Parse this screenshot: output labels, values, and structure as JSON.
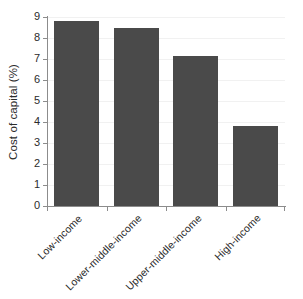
{
  "chart_data": {
    "type": "bar",
    "title": "",
    "subtitle": "",
    "xlabel": "",
    "ylabel": "Cost of capital (%)",
    "categories": [
      "Low-income",
      "Lower-middle-income",
      "Upper-middle-income",
      "High-income"
    ],
    "values": [
      8.8,
      8.5,
      7.15,
      3.8
    ],
    "ylim": [
      0,
      9
    ],
    "ytick_values": [
      0,
      1,
      2,
      3,
      4,
      5,
      6,
      7,
      8,
      9
    ],
    "ytick_labels": [
      "0",
      "1",
      "2",
      "3",
      "4",
      "5",
      "6",
      "7",
      "8",
      "9"
    ],
    "grid": "horizontal-faint",
    "legend": "none",
    "bar_color": "#4a4a4a",
    "axis_color": "#8c8c8c",
    "grid_color": "#f1f1f1",
    "background_color": "#ffffff",
    "xtick_label_rotation": -45,
    "annotations": []
  }
}
